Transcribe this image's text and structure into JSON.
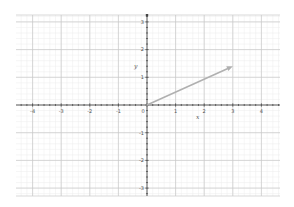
{
  "graph": {
    "x_range": [
      -4.5,
      4.6
    ],
    "y_range": [
      -3.3,
      3.4
    ],
    "x_ticks": [
      -4,
      -3,
      -2,
      -1,
      0,
      1,
      2,
      3,
      4
    ],
    "y_ticks": [
      3,
      2,
      1,
      -1,
      -2,
      -3
    ],
    "x_tick_labels": [
      "-4",
      "-3",
      "-2",
      "-1",
      "0",
      "1",
      "2",
      "3",
      "4"
    ],
    "y_tick_labels": [
      "3",
      "2",
      "1",
      "-1",
      "-2",
      "-3"
    ],
    "minor_step": 0.2,
    "x_axis_label": "x",
    "y_axis_label": "y",
    "vector": {
      "from": [
        0,
        0
      ],
      "to": [
        3,
        1.4
      ],
      "color": "#b0b0b0"
    },
    "colors": {
      "axis": "#444444",
      "major_grid": "#c8c8c8",
      "minor_grid": "#ececec",
      "background": "#ffffff"
    }
  },
  "chart_data": {
    "type": "line",
    "title": "",
    "xlabel": "x",
    "ylabel": "y",
    "xlim": [
      -4.5,
      4.6
    ],
    "ylim": [
      -3.3,
      3.4
    ],
    "grid": true,
    "series": [
      {
        "name": "vector",
        "x": [
          0,
          3
        ],
        "y": [
          0,
          1.4
        ]
      }
    ]
  }
}
